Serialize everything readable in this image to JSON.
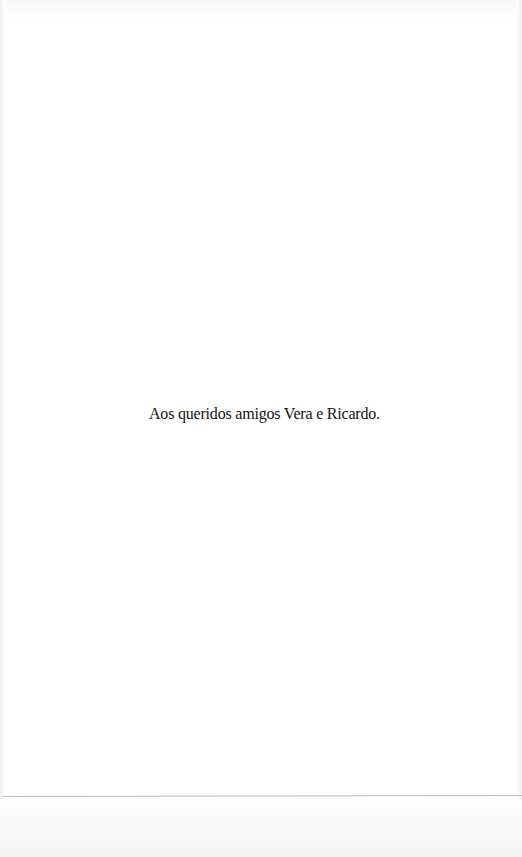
{
  "page": {
    "background_color": "#ffffff",
    "text_color": "#111111",
    "rule_color": "#bdbdbd"
  },
  "dedication": {
    "text": "Aos queridos amigos Vera e Ricardo."
  }
}
